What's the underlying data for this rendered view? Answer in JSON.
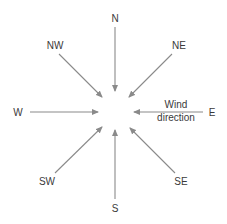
{
  "diagram": {
    "type": "compass-wind-direction",
    "colors": {
      "line": "#8a8a8a",
      "text": "#3a3a3a",
      "background": "#ffffff"
    },
    "directions": [
      {
        "id": "n",
        "label": "N"
      },
      {
        "id": "ne",
        "label": "NE"
      },
      {
        "id": "e",
        "label": "E"
      },
      {
        "id": "se",
        "label": "SE"
      },
      {
        "id": "s",
        "label": "S"
      },
      {
        "id": "sw",
        "label": "SW"
      },
      {
        "id": "w",
        "label": "W"
      },
      {
        "id": "nw",
        "label": "NW"
      }
    ],
    "annotation": {
      "line1": "Wind",
      "line2": "direction",
      "attached_to": "E"
    }
  }
}
